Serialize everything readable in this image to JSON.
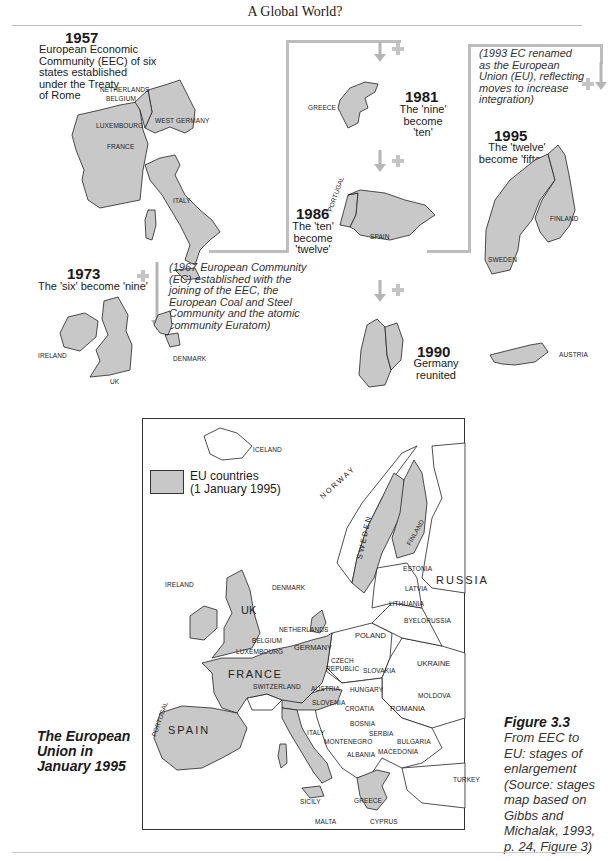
{
  "header": {
    "title": "A Global World?"
  },
  "stages": {
    "s1957": {
      "year": "1957",
      "caption": [
        "European Economic",
        "Community (EEC) of six",
        "states established",
        "under the Treaty",
        "of Rome"
      ],
      "countries": [
        "NETHERLANDS",
        "BELGIUM",
        "LUXEMBOURG",
        "WEST GERMANY",
        "FRANCE",
        "ITALY"
      ]
    },
    "s1967_note": [
      "(1967 European Community",
      "(EC) established with the",
      "joining of the EEC, the",
      "European Coal and Steel",
      "Community and the atomic",
      "community Euratom)"
    ],
    "s1973": {
      "year": "1973",
      "caption": "The 'six' become 'nine'",
      "countries": [
        "IRELAND",
        "UK",
        "DENMARK"
      ]
    },
    "s1981": {
      "year": "1981",
      "caption": [
        "The 'nine'",
        "become",
        "'ten'"
      ],
      "countries": [
        "GREECE"
      ]
    },
    "s1986": {
      "year": "1986",
      "caption": [
        "The 'ten'",
        "become",
        "'twelve'"
      ],
      "countries": [
        "PORTUGAL",
        "SPAIN"
      ]
    },
    "s1990": {
      "year": "1990",
      "caption": [
        "Germany",
        "reunited"
      ]
    },
    "s1993_note": [
      "(1993 EC renamed",
      "as the European",
      "Union (EU), reflecting",
      "moves to increase",
      "integration)"
    ],
    "s1995": {
      "year": "1995",
      "caption": [
        "The 'twelve'",
        "become 'fifteen'"
      ],
      "countries": [
        "FINLAND",
        "SWEDEN",
        "AUSTRIA"
      ]
    }
  },
  "map": {
    "legend": {
      "label_line1": "EU countries",
      "label_line2": "(1 January 1995)",
      "swatch_color": "#c8c8c8"
    },
    "labels": {
      "iceland": "ICELAND",
      "norway": "NORWAY",
      "sweden": "SWEDEN",
      "finland": "FINLAND",
      "estonia": "ESTONIA",
      "latvia": "LATVIA",
      "lithuania": "LITHUANIA",
      "russia": "RUSSIA",
      "ireland": "IRELAND",
      "uk": "UK",
      "denmark": "DENMARK",
      "netherlands": "NETHERLANDS",
      "belgium": "BELGIUM",
      "luxembourg": "LUXEMBOURG",
      "germany": "GERMANY",
      "poland": "POLAND",
      "byelorussia": "BYELORUSSIA",
      "czech1": "CZECH",
      "czech2": "REPUBLIC",
      "slovakia": "SLOVAKIA",
      "ukraine": "UKRAINE",
      "france": "FRANCE",
      "switzerland": "SWITZERLAND",
      "austria": "AUSTRIA",
      "hungary": "HUNGARY",
      "moldova": "MOLDOVA",
      "slovenia": "SLOVENIA",
      "croatia": "CROATIA",
      "romania": "ROMANIA",
      "portugal": "PORTUGAL",
      "spain": "SPAIN",
      "bosnia": "BOSNIA",
      "serbia": "SERBIA",
      "italy": "ITALY",
      "montenegro": "MONTENEGRO",
      "bulgaria": "BULGARIA",
      "albania": "ALBANIA",
      "macedonia": "MACEDONIA",
      "turkey": "TURKEY",
      "sicily": "SICILY",
      "greece": "GREECE",
      "malta": "MALTA",
      "cyprus": "CYPRUS"
    },
    "colors": {
      "eu": "#c8c8c8",
      "non_eu": "#ffffff",
      "border": "#222222",
      "arrow": "#b5b5b5"
    }
  },
  "side_title": [
    "The European",
    "Union in",
    "January 1995"
  ],
  "figure": {
    "number": "Figure 3.3",
    "caption": [
      "From EEC to",
      "EU: stages of",
      "enlargement",
      "(Source: stages",
      "map based on",
      "Gibbs and",
      "Michalak, 1993,",
      "p. 24, Figure 3)"
    ]
  }
}
